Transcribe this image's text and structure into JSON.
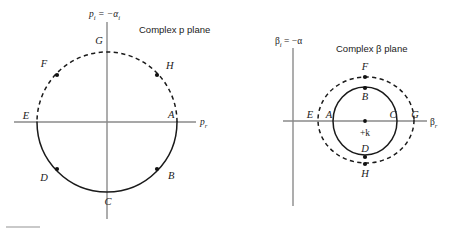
{
  "figure": {
    "width": 449,
    "height": 232,
    "background": "#ffffff",
    "stroke_color": "#1a1a1a",
    "axis_color": "#8a8a8a"
  },
  "panels": [
    {
      "id": "p-plane",
      "title": "Complex p plane",
      "vertical_axis_label": "p",
      "vertical_axis_sub": "i",
      "vertical_axis_equals": " = −α",
      "vertical_axis_equals_sub": "i",
      "horizontal_axis_label": "p",
      "horizontal_axis_sub": "r",
      "center": {
        "x": 107,
        "y": 122
      },
      "radius": 70,
      "solid_arc_desc": "lower half circle from E (left) through D, C, B to A (right)",
      "dashed_arc_desc": "upper half circle from A (right) through H, G, F to E (left)",
      "points": [
        {
          "label": "A",
          "x": 177,
          "y": 122,
          "dot": false,
          "label_x": 168,
          "label_y": 118
        },
        {
          "label": "B",
          "x": 157,
          "y": 169,
          "dot": true,
          "label_x": 168,
          "label_y": 179
        },
        {
          "label": "C",
          "x": 107,
          "y": 192,
          "dot": false,
          "label_x": 108,
          "label_y": 205
        },
        {
          "label": "D",
          "x": 57,
          "y": 169,
          "dot": true,
          "label_x": 44,
          "label_y": 181
        },
        {
          "label": "E",
          "x": 37,
          "y": 122,
          "dot": false,
          "label_x": 26,
          "label_y": 119
        },
        {
          "label": "F",
          "x": 57,
          "y": 75,
          "dot": true,
          "label_x": 44,
          "label_y": 67
        },
        {
          "label": "G",
          "x": 107,
          "y": 52,
          "dot": false,
          "label_x": 99,
          "label_y": 44
        },
        {
          "label": "H",
          "x": 157,
          "y": 75,
          "dot": true,
          "label_x": 166,
          "label_y": 69
        }
      ]
    },
    {
      "id": "beta-plane",
      "title": "Complex β plane",
      "vertical_axis_label": "β",
      "vertical_axis_sub": "i",
      "vertical_axis_equals": " = −α",
      "horizontal_axis_label": "β",
      "horizontal_axis_sub": "r",
      "center": {
        "x": 365,
        "y": 121
      },
      "origin_label": "+k",
      "solid_circle": {
        "cx": 365,
        "cy": 121,
        "rx": 32,
        "ry": 34
      },
      "dashed_circle": {
        "cx": 366,
        "cy": 120,
        "rx": 48,
        "ry": 43
      },
      "points": [
        {
          "label": "A",
          "x": 333,
          "y": 121,
          "dot": false,
          "label_x": 329,
          "label_y": 118
        },
        {
          "label": "B",
          "x": 365,
          "y": 88,
          "dot": true,
          "label_x": 365,
          "label_y": 100
        },
        {
          "label": "C",
          "x": 397,
          "y": 121,
          "dot": false,
          "label_x": 393,
          "label_y": 118
        },
        {
          "label": "D",
          "x": 365,
          "y": 157,
          "dot": true,
          "label_x": 365,
          "label_y": 152
        },
        {
          "label": "E",
          "x": 318,
          "y": 121,
          "dot": false,
          "label_x": 310,
          "label_y": 118
        },
        {
          "label": "F",
          "x": 365,
          "y": 77,
          "dot": true,
          "label_x": 365,
          "label_y": 70
        },
        {
          "label": "G",
          "x": 414,
          "y": 121,
          "dot": false,
          "label_x": 414,
          "label_y": 118
        },
        {
          "label": "H",
          "x": 365,
          "y": 164,
          "dot": true,
          "label_x": 365,
          "label_y": 177
        }
      ]
    }
  ]
}
